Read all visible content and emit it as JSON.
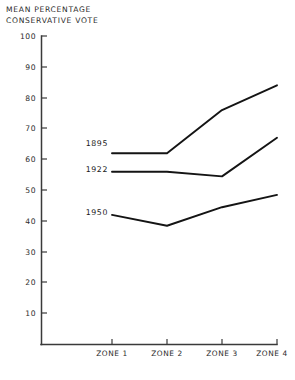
{
  "chart_data": {
    "type": "line",
    "title": "MEAN PERCENTAGE\nCONSERVATIVE VOTE",
    "title_line1": "MEAN PERCENTAGE",
    "title_line2": "CONSERVATIVE VOTE",
    "xlabel": "",
    "ylabel": "MEAN PERCENTAGE CONSERVATIVE VOTE",
    "categories": [
      "ZONE 1",
      "ZONE 2",
      "ZONE 3",
      "ZONE 4"
    ],
    "ylim": [
      0,
      100
    ],
    "yticks": [
      0,
      10,
      20,
      30,
      40,
      50,
      60,
      70,
      80,
      90,
      100
    ],
    "ytick_labels": [
      "",
      "10",
      "20",
      "30",
      "40",
      "50",
      "60",
      "70",
      "80",
      "90",
      "100"
    ],
    "grid": false,
    "legend_position": "inline-labels",
    "series": [
      {
        "name": "1895",
        "values": [
          62,
          62,
          76,
          84
        ],
        "label": "1895"
      },
      {
        "name": "1922",
        "values": [
          56,
          56,
          54.5,
          67
        ],
        "label": "1922"
      },
      {
        "name": "1950",
        "values": [
          42,
          38.5,
          44.5,
          48.5
        ],
        "label": "1950"
      }
    ],
    "annotations": [
      {
        "text": "1895",
        "series": "1895"
      },
      {
        "text": "1922",
        "series": "1922"
      },
      {
        "text": "1950",
        "series": "1950"
      }
    ]
  },
  "axis": {
    "y_labels": [
      "100",
      "90",
      "80",
      "70",
      "60",
      "50",
      "40",
      "30",
      "20",
      "10"
    ],
    "x_labels": [
      "ZONE 1",
      "ZONE 2",
      "ZONE 3",
      "ZONE 4"
    ]
  },
  "colors": {
    "line": "#141414",
    "axis": "#3a3a3a",
    "text": "#2b2b2b",
    "background": "#ffffff"
  }
}
